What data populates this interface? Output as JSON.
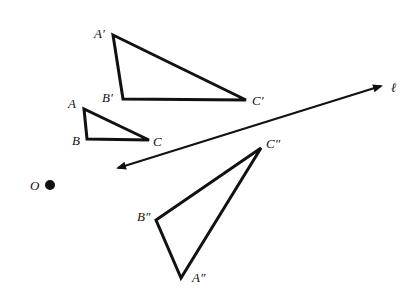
{
  "diagram": {
    "type": "geometry-transformations",
    "colors": {
      "ink": "#111111",
      "background": "#ffffff"
    },
    "point_O": {
      "label": "O",
      "x": 50,
      "y": 185,
      "r": 5
    },
    "line_l": {
      "label": "ℓ",
      "x1": 118,
      "y1": 168,
      "x2": 381,
      "y2": 86,
      "label_x": 391,
      "label_y": 92
    },
    "triangles": [
      {
        "name": "original",
        "vertices": [
          {
            "label": "A",
            "x": 84,
            "y": 109,
            "lx": 68,
            "ly": 108
          },
          {
            "label": "B",
            "x": 87,
            "y": 139,
            "lx": 72,
            "ly": 145
          },
          {
            "label": "C",
            "x": 149,
            "y": 140,
            "lx": 153,
            "ly": 146
          }
        ]
      },
      {
        "name": "image-prime",
        "vertices": [
          {
            "label": "A′",
            "x": 113,
            "y": 35,
            "lx": 94,
            "ly": 38
          },
          {
            "label": "B′",
            "x": 123,
            "y": 99,
            "lx": 102,
            "ly": 102
          },
          {
            "label": "C′",
            "x": 246,
            "y": 100,
            "lx": 252,
            "ly": 105
          }
        ]
      },
      {
        "name": "image-double-prime",
        "vertices": [
          {
            "label": "A″",
            "x": 181,
            "y": 278,
            "lx": 192,
            "ly": 282
          },
          {
            "label": "B″",
            "x": 156,
            "y": 220,
            "lx": 137,
            "ly": 221
          },
          {
            "label": "C″",
            "x": 261,
            "y": 148,
            "lx": 266,
            "ly": 148
          }
        ]
      }
    ]
  }
}
